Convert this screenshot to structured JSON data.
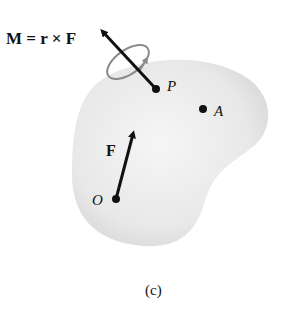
{
  "figure": {
    "moment_label": "M = r × F",
    "point_p_label": "P",
    "point_a_label": "A",
    "point_o_label": "O",
    "force_label": "F",
    "caption": "(c)"
  },
  "colors": {
    "body_fill": "#e6e6e6",
    "body_edge": "#cfcfcf",
    "arrow": "#111111",
    "rotation_ring": "#8a8a8a"
  }
}
